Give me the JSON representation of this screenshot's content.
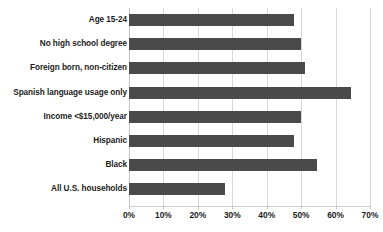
{
  "chart_data": {
    "type": "bar",
    "orientation": "horizontal",
    "title": "",
    "subtitle": "",
    "xlabel": "",
    "ylabel": "",
    "xlim": [
      0,
      70
    ],
    "xtick_step": 10,
    "grid": true,
    "legend": null,
    "bar_color": "#4a4a4a",
    "gridline_color": "#d8d8d8",
    "value_suffix": "%",
    "categories": [
      "Age 15-24",
      "No high school degree",
      "Foreign born, non-citizen",
      "Spanish language usage only",
      "Income <$15,000/year",
      "Hispanic",
      "Black",
      "All U.S. households"
    ],
    "values": [
      48,
      50,
      51,
      64.5,
      50,
      48,
      54.5,
      28
    ],
    "tick_labels": [
      "0%",
      "10%",
      "20%",
      "30%",
      "40%",
      "50%",
      "60%",
      "70%"
    ],
    "tick_values": [
      0,
      10,
      20,
      30,
      40,
      50,
      60,
      70
    ]
  }
}
